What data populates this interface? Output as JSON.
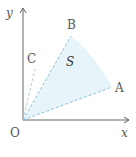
{
  "diagram": {
    "axes": {
      "x_label": "x",
      "y_label": "y",
      "origin_label": "O"
    },
    "points": [
      {
        "name": "A",
        "label": "A"
      },
      {
        "name": "B",
        "label": "B"
      },
      {
        "name": "C",
        "label": "C"
      }
    ],
    "region_label": "S",
    "colors": {
      "axis": "#555555",
      "dashed_line": "#7fb8dc",
      "region_fill": "#dff0f7",
      "text": "#555555"
    }
  }
}
